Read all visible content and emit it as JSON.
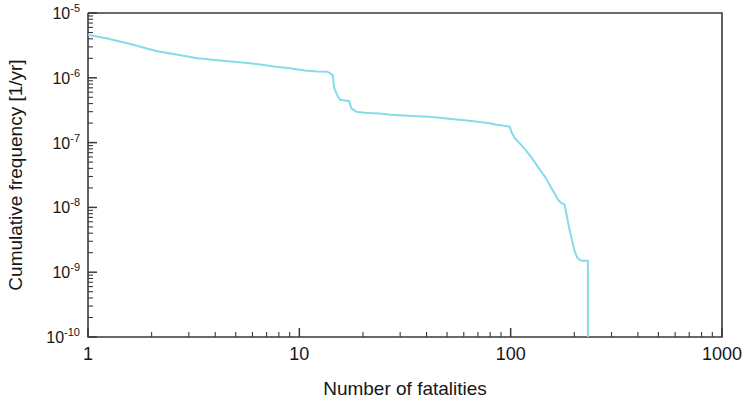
{
  "figure": {
    "background_color": "#ffffff",
    "frame_color": "#3a3a3a",
    "curve_color": "#86dbe9"
  },
  "chart_data": {
    "type": "line",
    "title": "",
    "subtitle": "",
    "xlabel": "Number of fatalities",
    "ylabel": "Cumulative frequency [1/yr]",
    "xscale": "log",
    "yscale": "log",
    "xlim": [
      1,
      1000
    ],
    "ylim": [
      1e-10,
      1e-05
    ],
    "grid": false,
    "legend": null,
    "annotations": [],
    "x_tick_labels": [
      "1",
      "10",
      "100",
      "1000"
    ],
    "x_tick_values": [
      1,
      10,
      100,
      1000
    ],
    "x_minor_ticks": [
      2,
      3,
      4,
      5,
      6,
      7,
      8,
      9,
      20,
      30,
      40,
      50,
      60,
      70,
      80,
      90,
      200,
      300,
      400,
      500,
      600,
      700,
      800,
      900
    ],
    "y_tick_labels": [
      "10⁻⁵",
      "10⁻⁶",
      "10⁻⁷",
      "10⁻⁸",
      "10⁻⁹",
      "10⁻¹⁰"
    ],
    "y_tick_mantissas": [
      "10",
      "10",
      "10",
      "10",
      "10",
      "10"
    ],
    "y_tick_exponents": [
      "-5",
      "-6",
      "-7",
      "-8",
      "-9",
      "-10"
    ],
    "y_tick_values": [
      1e-05,
      1e-06,
      1e-07,
      1e-08,
      1e-09,
      1e-10
    ],
    "series": [
      {
        "name": "Cumulative frequency curve",
        "color": "#86dbe9",
        "line_width": 2.0,
        "x": [
          1.0,
          1.25,
          1.6,
          2.1,
          2.7,
          3.3,
          3.9,
          4.6,
          5.4,
          6.4,
          7.6,
          9.0,
          10.6,
          12.2,
          13.6,
          14.4,
          14.6,
          15.2,
          15.6,
          16.2,
          17.2,
          17.6,
          18.6,
          20.4,
          22.2,
          24.0,
          27.0,
          31.0,
          36.0,
          41.0,
          47.0,
          54.0,
          62.0,
          70.0,
          78.0,
          85.0,
          90.0,
          95.0,
          99.0,
          101.0,
          104.0,
          108.0,
          113.0,
          118.0,
          124.0,
          130.0,
          136.0,
          141.0,
          146.0,
          151.0,
          157.0,
          163.0,
          168.0,
          172.0,
          176.0,
          180.0,
          185.0,
          190.0,
          196.0,
          201.0,
          206.0,
          212.0,
          218.0,
          224.0,
          228.0,
          232.0,
          232.0
        ],
        "y": [
          4.6e-06,
          4e-06,
          3.3e-06,
          2.6e-06,
          2.25e-06,
          2e-06,
          1.9e-06,
          1.8e-06,
          1.72e-06,
          1.62e-06,
          1.5e-06,
          1.4e-06,
          1.3e-06,
          1.25e-06,
          1.24e-06,
          1.1e-06,
          7e-07,
          5.2e-07,
          4.6e-07,
          4.5e-07,
          4.4e-07,
          3.4e-07,
          3e-07,
          2.9e-07,
          2.85e-07,
          2.8e-07,
          2.7e-07,
          2.62e-07,
          2.55e-07,
          2.5e-07,
          2.4e-07,
          2.3e-07,
          2.2e-07,
          2.1e-07,
          2e-07,
          1.9e-07,
          1.85e-07,
          1.8e-07,
          1.75e-07,
          1.45e-07,
          1.2e-07,
          1.05e-07,
          9e-08,
          7.6e-08,
          6.2e-08,
          5e-08,
          4e-08,
          3.4e-08,
          2.9e-08,
          2.4e-08,
          1.9e-08,
          1.55e-08,
          1.3e-08,
          1.2e-08,
          1.15e-08,
          1.1e-08,
          7e-09,
          4.5e-09,
          2.9e-09,
          2.1e-09,
          1.7e-09,
          1.55e-09,
          1.5e-09,
          1.5e-09,
          1.5e-09,
          1.5e-09,
          1e-10
        ]
      }
    ]
  }
}
